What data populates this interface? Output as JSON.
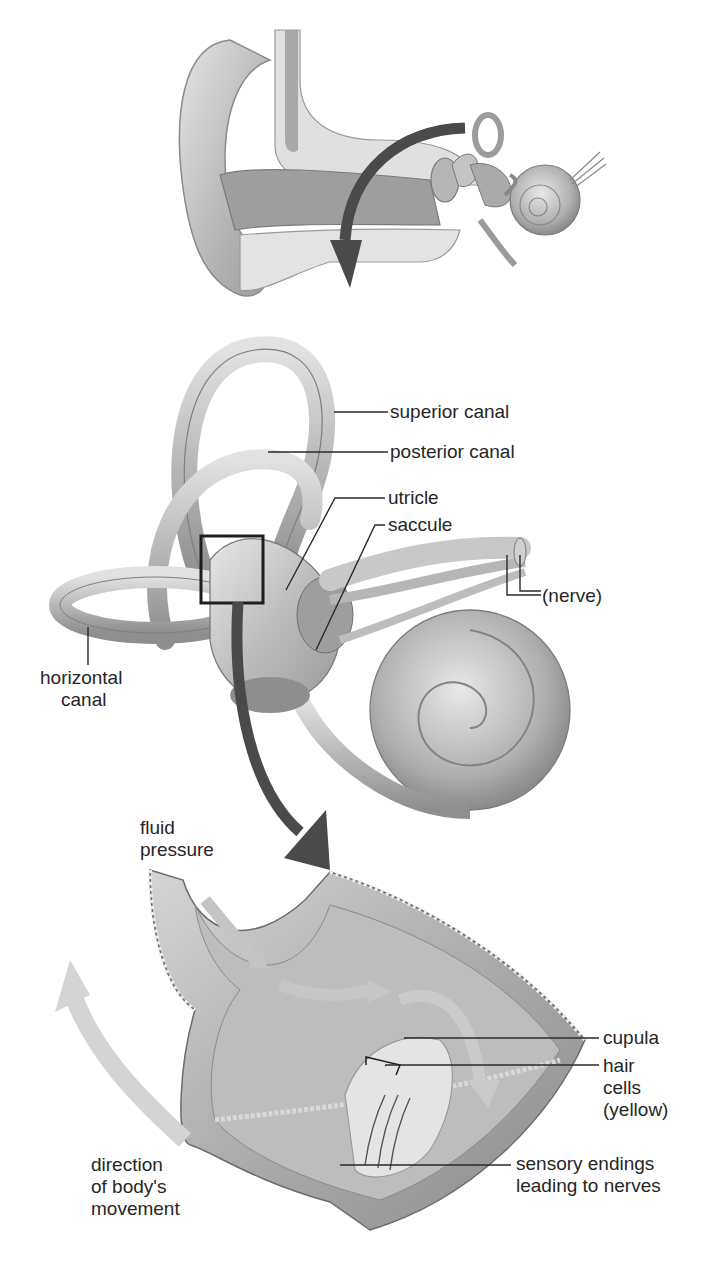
{
  "diagram": {
    "panels": [
      {
        "id": "outer-ear",
        "description": "Cross-section of human ear with arrow pointing to inner ear"
      },
      {
        "id": "inner-ear",
        "description": "Semicircular canals, utricle, saccule and cochlea"
      },
      {
        "id": "ampulla-detail",
        "description": "Enlarged section of canal ampulla showing cupula and hair cells"
      }
    ],
    "labels": {
      "superior_canal": "superior canal",
      "posterior_canal": "posterior canal",
      "utricle": "utricle",
      "saccule": "saccule",
      "nerve": "(nerve)",
      "horizontal_canal_1": "horizontal",
      "horizontal_canal_2": "canal",
      "fluid_pressure_1": "fluid",
      "fluid_pressure_2": "pressure",
      "cupula": "cupula",
      "hair_cells_1": "hair",
      "hair_cells_2": "cells",
      "hair_cells_3": "(yellow)",
      "sensory_endings_1": "sensory endings",
      "sensory_endings_2": "leading to nerves",
      "direction_1": "direction",
      "direction_2": "of body's",
      "direction_3": "movement"
    },
    "colors": {
      "tissue_light": "#d8d8d8",
      "tissue_mid": "#b4b4b4",
      "tissue_dark": "#8c8c8c",
      "arrow_dark": "#4a4a4a",
      "arrow_light": "#cfcfcf",
      "leader_line": "#2a2a2a"
    }
  }
}
